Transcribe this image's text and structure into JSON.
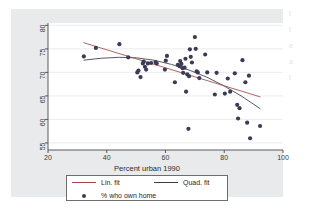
{
  "figure": {
    "background_color": "#e9eaec",
    "plot_background_color": "#ffffff",
    "axis_color": "#4a4a4a",
    "gridline_color": "#e4e4e6"
  },
  "legend": {
    "entries": [
      {
        "key": "line",
        "label": "Lin. fit",
        "color": "#a14949"
      },
      {
        "key": "line",
        "label": "Quad. fit",
        "color": "#3b3b4a"
      },
      {
        "key": "marker",
        "label": "% who own home",
        "color": "#3b3b55"
      }
    ]
  },
  "margin_bleed": {
    "lines": [
      "t",
      "t",
      "e",
      "a",
      "t"
    ]
  },
  "chart_data": {
    "type": "scatter",
    "title": "",
    "subtitle": "",
    "xlabel": "Percent urban 1990",
    "ylabel": "",
    "xlim": [
      20,
      100
    ],
    "ylim": [
      53.5,
      80.5
    ],
    "xticks": [
      20,
      40,
      60,
      80,
      100
    ],
    "xtick_labels": [
      "20",
      "40",
      "60",
      "80",
      "100"
    ],
    "yticks": [
      55,
      60,
      65,
      70,
      75,
      80
    ],
    "ytick_labels": [
      "55",
      "60",
      "65",
      "70",
      "75",
      "80"
    ],
    "grid": "horizontal",
    "legend_position": "below-axes",
    "series": [
      {
        "name": "% who own home",
        "type": "scatter",
        "marker": "filled-circle",
        "color": "#3b3b55",
        "marker_size": 4.2,
        "points": [
          [
            32.2,
            73.4
          ],
          [
            36.3,
            75.2
          ],
          [
            44.3,
            76.0
          ],
          [
            47.3,
            73.2
          ],
          [
            50.4,
            70.0
          ],
          [
            50.8,
            70.4
          ],
          [
            51.5,
            69.0
          ],
          [
            52.3,
            71.9
          ],
          [
            52.6,
            72.3
          ],
          [
            53.0,
            71.2
          ],
          [
            53.4,
            70.6
          ],
          [
            54.0,
            71.9
          ],
          [
            55.1,
            72.0
          ],
          [
            56.6,
            72.2
          ],
          [
            57.0,
            71.9
          ],
          [
            59.8,
            70.6
          ],
          [
            60.1,
            72.5
          ],
          [
            60.5,
            73.5
          ],
          [
            63.2,
            67.9
          ],
          [
            64.2,
            71.6
          ],
          [
            64.8,
            71.3
          ],
          [
            65.0,
            72.4
          ],
          [
            65.4,
            71.8
          ],
          [
            65.8,
            70.9
          ],
          [
            66.0,
            69.9
          ],
          [
            66.5,
            71.0
          ],
          [
            66.8,
            72.9
          ],
          [
            67.0,
            65.9
          ],
          [
            67.4,
            69.6
          ],
          [
            67.8,
            58.0
          ],
          [
            68.0,
            69.2
          ],
          [
            68.3,
            74.9
          ],
          [
            68.6,
            73.3
          ],
          [
            69.0,
            72.1
          ],
          [
            70.0,
            77.5
          ],
          [
            70.3,
            75.0
          ],
          [
            70.6,
            70.2
          ],
          [
            71.0,
            70.0
          ],
          [
            71.5,
            68.8
          ],
          [
            73.5,
            73.8
          ],
          [
            74.2,
            70.0
          ],
          [
            76.8,
            65.3
          ],
          [
            77.4,
            69.9
          ],
          [
            80.2,
            65.5
          ],
          [
            81.2,
            68.7
          ],
          [
            82.0,
            65.9
          ],
          [
            83.6,
            69.8
          ],
          [
            84.4,
            63.1
          ],
          [
            84.7,
            60.2
          ],
          [
            85.2,
            62.4
          ],
          [
            86.2,
            72.6
          ],
          [
            87.2,
            67.9
          ],
          [
            87.8,
            59.3
          ],
          [
            88.4,
            69.3
          ],
          [
            88.8,
            56.0
          ],
          [
            92.2,
            58.6
          ]
        ]
      },
      {
        "name": "Lin. fit",
        "type": "line",
        "color": "#a14949",
        "x_start": 32.2,
        "x_end": 92.2,
        "y_start": 76.3,
        "y_end": 64.8
      },
      {
        "name": "Quad. fit",
        "type": "line",
        "color": "#3b3b4a",
        "x_start": 32.2,
        "x_end": 92.2,
        "curve_points": [
          [
            32.2,
            72.6
          ],
          [
            38.0,
            73.0
          ],
          [
            44.0,
            73.2
          ],
          [
            50.0,
            73.1
          ],
          [
            56.0,
            72.6
          ],
          [
            62.0,
            71.7
          ],
          [
            68.0,
            70.5
          ],
          [
            74.0,
            69.0
          ],
          [
            80.0,
            67.1
          ],
          [
            86.0,
            64.9
          ],
          [
            92.2,
            62.3
          ]
        ]
      }
    ]
  }
}
